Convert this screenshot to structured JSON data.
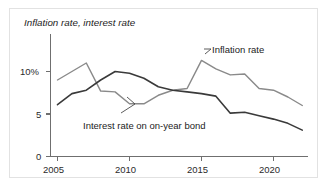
{
  "figure": {
    "title": "Inflation rate, interest rate",
    "background_color": "#ffffff",
    "frame_color": "#e2e2e2"
  },
  "annotations": {
    "inflation_label": "Inflation rate",
    "interest_label": "Interest rate on on-year bond"
  },
  "axes": {
    "y_ticks": [
      "10%",
      "5",
      "0"
    ],
    "x_ticks": [
      "2005",
      "2010",
      "2015",
      "2020"
    ]
  },
  "chart_data": {
    "type": "line",
    "title": "Inflation rate, interest rate",
    "xlabel": "",
    "ylabel": "",
    "xlim": [
      2005,
      2022
    ],
    "ylim": [
      0,
      13
    ],
    "grid": false,
    "legend": "annotations-on-plot",
    "y_tick_values": [
      0,
      5,
      10
    ],
    "y_tick_labels": [
      "0",
      "5",
      "10%"
    ],
    "x_tick_values": [
      2005,
      2010,
      2015,
      2020
    ],
    "x_tick_labels": [
      "2005",
      "2010",
      "2015",
      "2020"
    ],
    "x": [
      2005,
      2006,
      2007,
      2008,
      2009,
      2010,
      2011,
      2012,
      2013,
      2014,
      2015,
      2016,
      2017,
      2018,
      2019,
      2020,
      2021,
      2022
    ],
    "series": [
      {
        "name": "Inflation rate",
        "color": "#8a8a8a",
        "values": [
          9.0,
          10.0,
          11.0,
          7.7,
          7.6,
          6.2,
          6.2,
          7.2,
          7.8,
          8.0,
          11.3,
          10.3,
          9.6,
          9.7,
          8.0,
          7.8,
          7.0,
          6.0
        ]
      },
      {
        "name": "Interest rate on on-year bond",
        "color": "#3a3a3a",
        "values": [
          6.1,
          7.4,
          7.8,
          9.0,
          10.0,
          9.8,
          9.2,
          8.2,
          7.8,
          7.6,
          7.4,
          7.1,
          5.1,
          5.2,
          4.8,
          4.4,
          3.9,
          3.1
        ]
      }
    ]
  }
}
